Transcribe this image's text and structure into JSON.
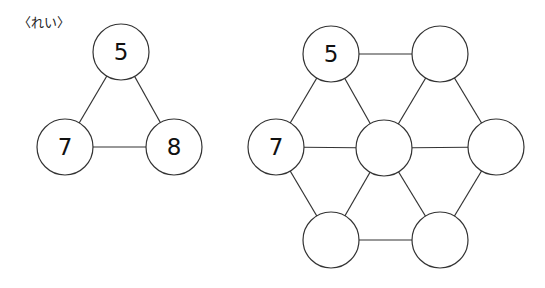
{
  "example_label": "〈れい〉",
  "colors": {
    "stroke": "#333333",
    "fill": "#ffffff",
    "text": "#111111"
  },
  "example": {
    "nodes": [
      {
        "id": "top",
        "x": 121,
        "y": 52,
        "value": "5"
      },
      {
        "id": "left",
        "x": 65,
        "y": 147,
        "value": "7"
      },
      {
        "id": "right",
        "x": 174,
        "y": 147,
        "value": "8"
      }
    ],
    "edges": [
      [
        "top",
        "left"
      ],
      [
        "top",
        "right"
      ],
      [
        "left",
        "right"
      ]
    ]
  },
  "puzzle": {
    "nodes": [
      {
        "id": "tl",
        "x": 331,
        "y": 54,
        "value": "5"
      },
      {
        "id": "tr",
        "x": 440,
        "y": 54,
        "value": ""
      },
      {
        "id": "l",
        "x": 276,
        "y": 147,
        "value": "7"
      },
      {
        "id": "c",
        "x": 384,
        "y": 148,
        "value": ""
      },
      {
        "id": "r",
        "x": 496,
        "y": 147,
        "value": ""
      },
      {
        "id": "bl",
        "x": 331,
        "y": 240,
        "value": ""
      },
      {
        "id": "br",
        "x": 440,
        "y": 240,
        "value": ""
      }
    ],
    "edges": [
      [
        "tl",
        "tr"
      ],
      [
        "tl",
        "l"
      ],
      [
        "tl",
        "c"
      ],
      [
        "tr",
        "c"
      ],
      [
        "tr",
        "r"
      ],
      [
        "l",
        "c"
      ],
      [
        "c",
        "r"
      ],
      [
        "l",
        "bl"
      ],
      [
        "c",
        "bl"
      ],
      [
        "c",
        "br"
      ],
      [
        "r",
        "br"
      ],
      [
        "bl",
        "br"
      ]
    ]
  },
  "node_radius": 28
}
